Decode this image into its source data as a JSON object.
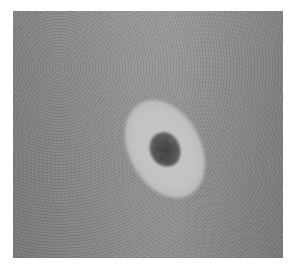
{
  "image": {
    "subject": "skin-lesion-halo",
    "colors": {
      "background": "#ffffff",
      "skin": "#8f8f8f",
      "halo": "#c4c4c4",
      "nevus": "#404040"
    }
  }
}
